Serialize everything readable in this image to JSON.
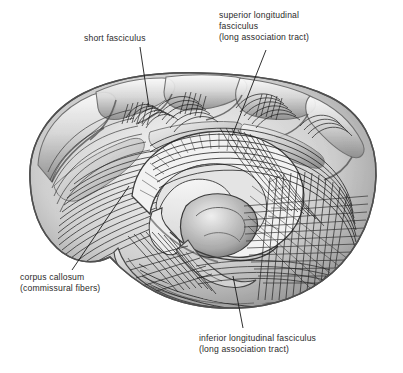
{
  "figure": {
    "background_color": "#ffffff",
    "ink_color": "#2b2b2b",
    "width": 403,
    "height": 373
  },
  "labels": [
    {
      "id": "short-fasciculus",
      "lines": [
        "short fasciculus"
      ],
      "text": "short fasciculus",
      "leader": {
        "from": [
          140,
          47
        ],
        "to": [
          149,
          107
        ]
      }
    },
    {
      "id": "superior-longitudinal-fasciculus",
      "lines": [
        "superior longitudinal",
        "fasciculus",
        "(long association tract)"
      ],
      "text": "superior longitudinal\nfasciculus\n(long association tract)",
      "leader": {
        "from": [
          266,
          50
        ],
        "to": [
          232,
          136
        ]
      }
    },
    {
      "id": "corpus-callosum",
      "lines": [
        "corpus callosum",
        "(commissural fibers)"
      ],
      "text": "corpus callosum\n(commissural fibers)",
      "leader": {
        "from": [
          129,
          186
        ],
        "to": [
          72,
          270
        ]
      }
    },
    {
      "id": "inferior-longitudinal-fasciculus",
      "lines": [
        "inferior longitudinal fasciculus",
        "(long association tract)"
      ],
      "text": "inferior longitudinal fasciculus\n(long association tract)",
      "leader": {
        "from": [
          243,
          328
        ],
        "to": [
          233,
          276
        ]
      }
    }
  ],
  "anatomy": {
    "regions": [
      {
        "name": "frontal-lobe",
        "center": [
          85,
          165
        ]
      },
      {
        "name": "parietal-lobe",
        "center": [
          225,
          110
        ]
      },
      {
        "name": "occipital-lobe",
        "center": [
          330,
          200
        ]
      },
      {
        "name": "temporal-lobe",
        "center": [
          210,
          270
        ]
      },
      {
        "name": "corpus-callosum",
        "center": [
          205,
          175
        ]
      },
      {
        "name": "lateral-ventricle",
        "center": [
          235,
          205
        ]
      },
      {
        "name": "brainstem",
        "center": [
          200,
          245
        ]
      }
    ]
  }
}
